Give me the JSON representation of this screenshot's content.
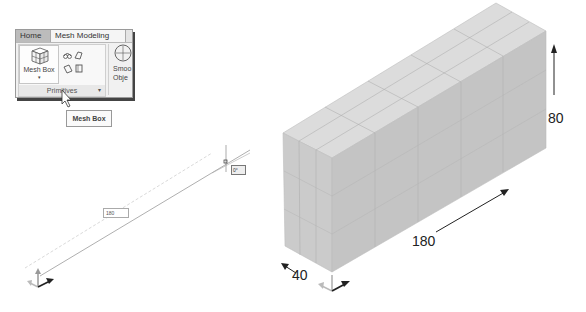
{
  "ribbon": {
    "tabs": [
      {
        "label": "Home",
        "active": false
      },
      {
        "label": "Mesh Modeling",
        "active": true
      }
    ],
    "panel": {
      "title": "Primitives",
      "expander_icon": "panel-expander-icon",
      "mesh_box_button": {
        "label": "Mesh Box",
        "caret": "▾",
        "icon": "mesh-box-icon"
      },
      "small_icons": [
        "mesh-cylinder-icon",
        "mesh-wedge-icon",
        "mesh-cone-icon",
        "mesh-torus-icon"
      ]
    },
    "smooth_object": {
      "label_line1": "Smoo",
      "label_line2": "Obje",
      "icon": "smooth-object-icon"
    }
  },
  "tooltip": {
    "text": "Mesh Box"
  },
  "drawing": {
    "length_input": "180",
    "angle_tooltip": "0°"
  },
  "result": {
    "dimensions": {
      "length": "180",
      "width": "40",
      "height": "80"
    }
  },
  "colors": {
    "mesh_top": "#dcdcdc",
    "mesh_front": "#c6c6c6",
    "mesh_side": "#cfcfcf",
    "mesh_lines": "#a8a8a8",
    "ucs_gray": "#999999",
    "ucs_dark": "#222222"
  }
}
